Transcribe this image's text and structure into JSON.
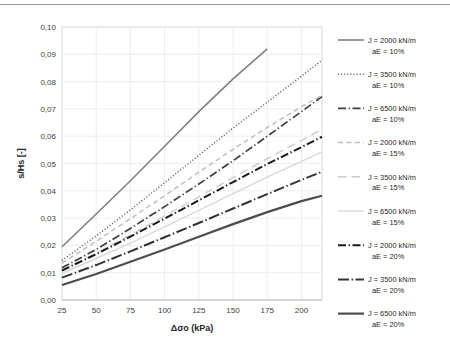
{
  "figure": {
    "background_color": "#ffffff",
    "border_color": "#d9d9d9",
    "plot_border_color": "#d0d0d0",
    "gridline_color": "#ececec"
  },
  "chart_data": {
    "type": "line",
    "title": "",
    "xlabel": "Δσo (kPa)",
    "ylabel": "s/Hs [-]",
    "xlim": [
      25,
      215
    ],
    "ylim": [
      0.0,
      0.1
    ],
    "x_ticks": [
      25,
      50,
      75,
      100,
      125,
      150,
      175,
      200
    ],
    "y_ticks": [
      "0,00",
      "0,01",
      "0,02",
      "0,03",
      "0,04",
      "0,05",
      "0,06",
      "0,07",
      "0,08",
      "0,09",
      "0,10"
    ],
    "y_tick_values": [
      0.0,
      0.01,
      0.02,
      0.03,
      0.04,
      0.05,
      0.06,
      0.07,
      0.08,
      0.09,
      0.1
    ],
    "grid": true,
    "legend_position": "right",
    "series": [
      {
        "name": "J = 2000 kN/m\naE = 10%",
        "label_line1": "J = 2000 kN/m",
        "label_line2": "aE = 10%",
        "J": 2000,
        "aE": "10%",
        "color": "#808080",
        "width": 1.6,
        "dash": "none",
        "x": [
          25,
          50,
          75,
          100,
          125,
          150,
          175
        ],
        "y": [
          0.0195,
          0.0315,
          0.0437,
          0.0563,
          0.069,
          0.081,
          0.092
        ]
      },
      {
        "name": "J = 3500 kN/m\naE = 10%",
        "label_line1": "J = 3500 kN/m",
        "label_line2": "aE = 10%",
        "J": 3500,
        "aE": "10%",
        "color": "#595959",
        "width": 1.5,
        "dash": "dotted",
        "x": [
          25,
          50,
          75,
          100,
          125,
          150,
          175,
          200,
          215
        ],
        "y": [
          0.0145,
          0.0235,
          0.033,
          0.043,
          0.053,
          0.063,
          0.0725,
          0.082,
          0.0878
        ]
      },
      {
        "name": "J = 6500 kN/m\naE = 10%",
        "label_line1": "J = 6500 kN/m",
        "label_line2": "aE = 10%",
        "J": 6500,
        "aE": "10%",
        "color": "#3f3f3f",
        "width": 1.7,
        "dash": "dashdot",
        "x": [
          25,
          50,
          75,
          100,
          125,
          150,
          175,
          200,
          215
        ],
        "y": [
          0.0118,
          0.0185,
          0.0262,
          0.0342,
          0.0425,
          0.051,
          0.06,
          0.069,
          0.0745
        ]
      },
      {
        "name": "J = 2000 kN/m\naE = 15%",
        "label_line1": "J = 2000 kN/m",
        "label_line2": "aE = 15%",
        "J": 2000,
        "aE": "15%",
        "color": "#bfbfbf",
        "width": 1.5,
        "dash": "dashed",
        "x": [
          25,
          50,
          75,
          100,
          125,
          150,
          175,
          200,
          215
        ],
        "y": [
          0.0135,
          0.0215,
          0.0298,
          0.0382,
          0.0468,
          0.0552,
          0.0632,
          0.0708,
          0.075
        ]
      },
      {
        "name": "J = 3500 kN/m\naE = 15%",
        "label_line1": "J = 3500 kN/m",
        "label_line2": "aE = 15%",
        "J": 3500,
        "aE": "15%",
        "color": "#cccccc",
        "width": 1.4,
        "dash": "longdash",
        "x": [
          25,
          50,
          75,
          100,
          125,
          150,
          175,
          200,
          215
        ],
        "y": [
          0.011,
          0.0172,
          0.0238,
          0.0308,
          0.0378,
          0.0448,
          0.0518,
          0.0585,
          0.0625
        ]
      },
      {
        "name": "J = 6500 kN/m\naE = 15%",
        "label_line1": "J = 6500 kN/m",
        "label_line2": "aE = 15%",
        "J": 6500,
        "aE": "15%",
        "color": "#d9d9d9",
        "width": 1.4,
        "dash": "none",
        "x": [
          25,
          50,
          75,
          100,
          125,
          150,
          175,
          200,
          215
        ],
        "y": [
          0.0098,
          0.0152,
          0.0208,
          0.0268,
          0.0328,
          0.039,
          0.045,
          0.0508,
          0.0543
        ]
      },
      {
        "name": "J = 2000 kN/m\naE = 20%",
        "label_line1": "J = 2000 kN/m",
        "label_line2": "aE = 20%",
        "J": 2000,
        "aE": "20%",
        "color": "#1a1a1a",
        "width": 2.0,
        "dash": "dashdot",
        "x": [
          25,
          50,
          75,
          100,
          125,
          150,
          175,
          200,
          215
        ],
        "y": [
          0.0108,
          0.0168,
          0.0232,
          0.0298,
          0.0365,
          0.0432,
          0.0498,
          0.056,
          0.0598
        ]
      },
      {
        "name": "J = 3500 kN/m\naE = 20%",
        "label_line1": "J = 3500 kN/m",
        "label_line2": "aE = 20%",
        "J": 3500,
        "aE": "20%",
        "color": "#333333",
        "width": 2.0,
        "dash": "dashdot-long",
        "x": [
          25,
          50,
          75,
          100,
          125,
          150,
          175,
          200,
          215
        ],
        "y": [
          0.0082,
          0.0128,
          0.0178,
          0.023,
          0.0282,
          0.0335,
          0.0388,
          0.044,
          0.047
        ]
      },
      {
        "name": "J = 6500 kN/m\naE = 20%",
        "label_line1": "J = 6500 kN/m",
        "label_line2": "aE = 20%",
        "J": 6500,
        "aE": "20%",
        "color": "#4d4d4d",
        "width": 2.2,
        "dash": "none",
        "x": [
          25,
          50,
          75,
          100,
          125,
          150,
          175,
          200,
          215
        ],
        "y": [
          0.0055,
          0.0095,
          0.014,
          0.0185,
          0.0232,
          0.0278,
          0.0322,
          0.0362,
          0.0382
        ]
      }
    ]
  }
}
